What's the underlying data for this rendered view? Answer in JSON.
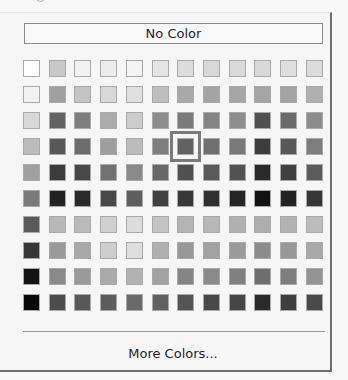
{
  "popup": {
    "no_color_label": "No Color",
    "more_colors_label": "More Colors...",
    "selected": {
      "row": 3,
      "col": 6
    },
    "columns": 12,
    "rows": 10
  },
  "palette": [
    [
      "#ffffff",
      "#c8c8c8",
      "#f2f2f2",
      "#ececec",
      "#f4f4f4",
      "#e4e4e4",
      "#dcdcdc",
      "#d8d8d8",
      "#dadada",
      "#d9d9d9",
      "#dedede",
      "#dcdcdc"
    ],
    [
      "#f2f2f2",
      "#a0a0a0",
      "#c4c4c4",
      "#d8d8d8",
      "#e0e0e0",
      "#bebebe",
      "#a8a8a8",
      "#a4a4a4",
      "#a6a6a6",
      "#a5a5a5",
      "#a4a4a4",
      "#b0b0b0"
    ],
    [
      "#d8d8d8",
      "#626262",
      "#7e7e7e",
      "#ababab",
      "#cccccc",
      "#8e8e8e",
      "#7a7a7a",
      "#848484",
      "#8e8e8e",
      "#505050",
      "#6a6a6a",
      "#8c8c8c"
    ],
    [
      "#bcbcbc",
      "#585858",
      "#6c6c6c",
      "#9e9e9e",
      "#bcbcbc",
      "#7e7e7e",
      "#626262",
      "#707070",
      "#7a7a7a",
      "#3c3c3c",
      "#585858",
      "#7e7e7e"
    ],
    [
      "#a0a0a0",
      "#3c3c3c",
      "#484848",
      "#727272",
      "#8a8a8a",
      "#686868",
      "#505050",
      "#5a5a5a",
      "#525252",
      "#2a2a2a",
      "#404040",
      "#5c5c5c"
    ],
    [
      "#7a7a7a",
      "#222222",
      "#2a2a2a",
      "#484848",
      "#5e5e5e",
      "#404040",
      "#383838",
      "#303030",
      "#262626",
      "#121212",
      "#222222",
      "#363636"
    ],
    [
      "#5a5a5a",
      "#b8b8b8",
      "#bababa",
      "#d0d0d0",
      "#dcdcdc",
      "#c4c4c4",
      "#b4b4b4",
      "#b8b8b8",
      "#b0b0b0",
      "#aeaeae",
      "#b2b2b2",
      "#bcbcbc"
    ],
    [
      "#363636",
      "#9a9a9a",
      "#a8a8a8",
      "#cecece",
      "#dedede",
      "#b0b0b0",
      "#989898",
      "#a2a2a2",
      "#9a9a9a",
      "#8c8c8c",
      "#989898",
      "#a8a8a8"
    ],
    [
      "#141414",
      "#8a8a8a",
      "#9a9a9a",
      "#aaaaaa",
      "#b2b2b2",
      "#a2a2a2",
      "#858585",
      "#8a8a8a",
      "#808080",
      "#6e6e6e",
      "#7e7e7e",
      "#949494"
    ],
    [
      "#080808",
      "#4c4c4c",
      "#585858",
      "#5c5c5c",
      "#6a6a6a",
      "#606060",
      "#545454",
      "#484848",
      "#464646",
      "#2a2a2a",
      "#3e3e3e",
      "#4a4a4a"
    ]
  ]
}
